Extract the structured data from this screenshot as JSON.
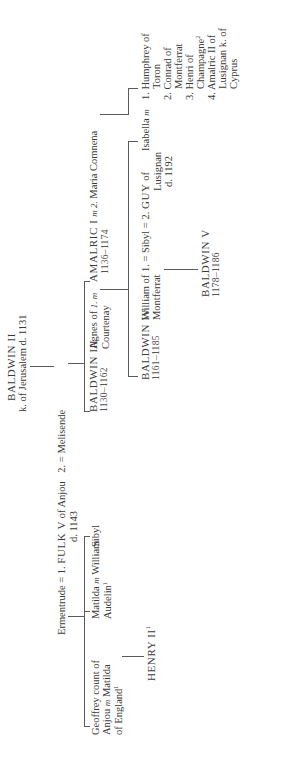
{
  "baldwin_ii": {
    "name": "BALDWIN II",
    "title": "k. of Jerusalem d. 1131"
  },
  "fulk_line": {
    "ermentrude": "Ermentrude",
    "marriage1": "= 1.",
    "fulk": "FULK V",
    "of": "of Anjou",
    "marriage2": "2. =",
    "melisende": "Melisende",
    "death": "d. 1143"
  },
  "fulk_children": {
    "geoffrey": {
      "line1": "Geoffrey count of",
      "line2a": "Anjou",
      "m": "m",
      "line2b": "Matilda",
      "line3": "of England",
      "note": "1"
    },
    "matilda": {
      "line1a": "Matilda",
      "m": "m",
      "line1b": "William",
      "line2": "Audelin",
      "note": "1"
    },
    "sibyl": {
      "name": "Sibyl"
    }
  },
  "henry_ii": {
    "name": "HENRY II",
    "note": "1"
  },
  "baldwin_iii": {
    "name": "BALDWIN III",
    "dates": "1130–1162"
  },
  "agnes": {
    "line1": "Agnes of",
    "line2": "Courtenay",
    "m": "1. m"
  },
  "amalric": {
    "name": "AMALRIC I",
    "m": "m 2.",
    "dates": "1136–1174"
  },
  "maria": {
    "name": "Maria Comnena"
  },
  "baldwin_iv": {
    "name": "BALDWIN IV",
    "dates": "1161–1185"
  },
  "william_m": {
    "line1": "William of",
    "line2": "Montferrat",
    "marriage": "1. ="
  },
  "sibyl_queen": {
    "name": "Sibyl",
    "marriage": "= 2."
  },
  "guy": {
    "name": "GUY",
    "line1": "of",
    "line2": "Lusignan",
    "death": "d. 1192"
  },
  "baldwin_v": {
    "name": "BALDWIN V",
    "dates": "1178–1186"
  },
  "isabella": {
    "name": "Isabella",
    "m": "m"
  },
  "isabella_husbands": [
    {
      "num": "1.",
      "line1": "Humphrey of",
      "line2": "Toron",
      "note": ""
    },
    {
      "num": "2.",
      "line1": "Conrad of",
      "line2": "Montferrat",
      "note": ""
    },
    {
      "num": "3.",
      "line1": "Henri of",
      "line2": "Champagne",
      "note": "2"
    },
    {
      "num": "4.",
      "line1": "Amalric II of",
      "line2": "Lusignan k. of",
      "line3": "Cyprus"
    }
  ]
}
